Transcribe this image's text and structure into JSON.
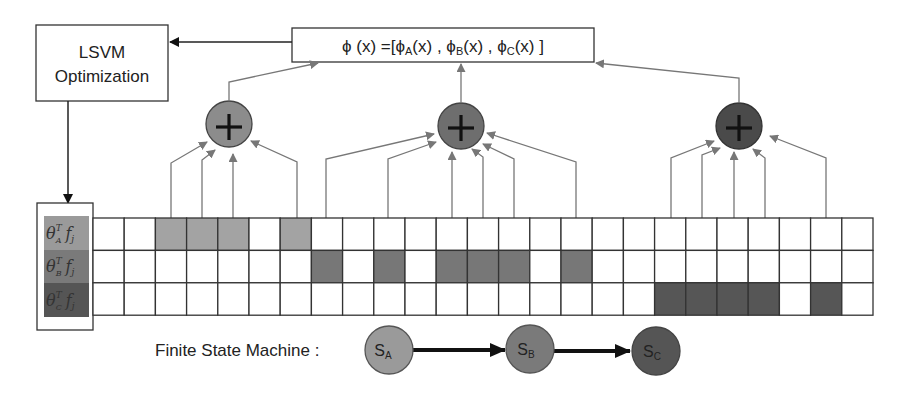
{
  "diagram": {
    "optimizer_box": {
      "line1": "LSVM",
      "line2": "Optimization"
    },
    "feature_vector": {
      "text": "ϕ (x) =[ϕA(x) , ϕB(x) , ϕC(x) ]",
      "parts": {
        "phi": "ϕ (x) =[",
        "phiA": "ϕ",
        "subA": "A",
        "argA": "(x) , ",
        "phiB": "ϕ",
        "subB": "B",
        "argB": "(x) , ",
        "phiC": "ϕ",
        "subC": "C",
        "argC": "(x) ]"
      }
    },
    "sum_nodes": [
      {
        "name": "sum-node-a",
        "symbol": "+",
        "color": "#8c8c8c"
      },
      {
        "name": "sum-node-b",
        "symbol": "+",
        "color": "#6e6e6e"
      },
      {
        "name": "sum-node-c",
        "symbol": "+",
        "color": "#4a4a4a"
      }
    ],
    "score_labels": [
      {
        "theta": "θ",
        "sup": "T",
        "sub": "A",
        "f": "f",
        "fsub": "j",
        "color": "#9a9a9a"
      },
      {
        "theta": "θ",
        "sup": "T",
        "sub": "B",
        "f": "f",
        "fsub": "j",
        "color": "#7a7a7a"
      },
      {
        "theta": "θ",
        "sup": "T",
        "sub": "C",
        "f": "f",
        "fsub": "j",
        "color": "#555555"
      }
    ],
    "grid": {
      "columns": 25,
      "rows": 3,
      "shaded": {
        "row_a": [
          2,
          3,
          4,
          6
        ],
        "row_b": [
          7,
          9,
          11,
          12,
          13,
          15
        ],
        "row_c": [
          18,
          19,
          20,
          21,
          23
        ]
      },
      "colors": {
        "row_a": "#a3a3a3",
        "row_b": "#777777",
        "row_c": "#565656"
      }
    },
    "fsm": {
      "label": "Finite State Machine :",
      "states": [
        {
          "letter": "S",
          "sub": "A",
          "color": "#9a9a9a"
        },
        {
          "letter": "S",
          "sub": "B",
          "color": "#7a7a7a"
        },
        {
          "letter": "S",
          "sub": "C",
          "color": "#555555"
        }
      ]
    }
  }
}
